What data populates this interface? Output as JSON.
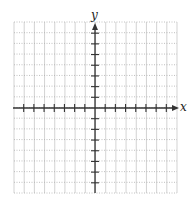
{
  "chart_data": {
    "type": "blank-coordinate-grid",
    "title": "",
    "xlabel": "x",
    "ylabel": "y",
    "x_range": [
      -8,
      8
    ],
    "y_range": [
      -8,
      8
    ],
    "x_ticks_per_side": 7,
    "y_ticks_per_side": 7,
    "grid": true,
    "grid_style": {
      "vertical": "solid",
      "horizontal": "dotted"
    },
    "series": []
  },
  "axes": {
    "x_label": "x",
    "y_label": "y",
    "x_arrow": "right",
    "y_arrow": "up"
  },
  "colors": {
    "grid": "#c8c8c8",
    "axis": "#333333",
    "background": "#ffffff"
  },
  "geometry": {
    "grid_left": 14,
    "grid_top": 22,
    "grid_right": 177,
    "grid_bottom": 193,
    "origin_x": 95,
    "origin_y": 108,
    "step_x": 10.2,
    "step_y": 10.7
  }
}
